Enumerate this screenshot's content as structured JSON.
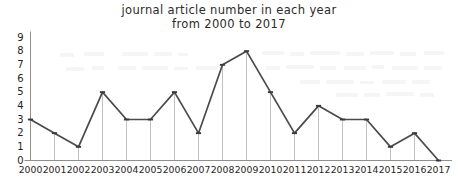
{
  "chart_data": {
    "type": "line",
    "title": "journal article number in each year from 2000 to 2017",
    "title_lines": [
      "journal article number in each year",
      "from 2000 to 2017"
    ],
    "xlabel": "",
    "ylabel": "",
    "categories": [
      "2000",
      "2001",
      "2002",
      "2003",
      "2004",
      "2005",
      "2006",
      "2007",
      "2008",
      "2009",
      "2010",
      "2011",
      "2012",
      "2013",
      "2014",
      "2015",
      "2016",
      "2017"
    ],
    "values": [
      3,
      2,
      1,
      5,
      3,
      3,
      5,
      2,
      7,
      8,
      5,
      2,
      4,
      3,
      3,
      1,
      2,
      0
    ],
    "series": [
      {
        "name": "journal article number",
        "values": [
          3,
          2,
          1,
          5,
          3,
          3,
          5,
          2,
          7,
          8,
          5,
          2,
          4,
          3,
          3,
          1,
          2,
          0
        ]
      }
    ],
    "ylim": [
      0,
      9
    ],
    "ytick_labels": [
      "0",
      "1",
      "2",
      "3",
      "4",
      "5",
      "6",
      "7",
      "8",
      "9"
    ],
    "yticks": [
      0,
      1,
      2,
      3,
      4,
      5,
      6,
      7,
      8,
      9
    ],
    "xtick_labels": [
      "2000",
      "2001",
      "2002",
      "2003",
      "2004",
      "2005",
      "2006",
      "2007",
      "2008",
      "2009",
      "2010",
      "2011",
      "2012",
      "2013",
      "2014",
      "2015",
      "2016",
      "2017"
    ],
    "grid": false,
    "droplines": true,
    "markers": true,
    "legend": null,
    "legend_position": "none",
    "colors": {
      "line": "#4a4a4a",
      "marker": "#3a3a3a",
      "dropline": "#b9b9b9",
      "axis": "#8f8f8f",
      "text": "#1f1f1f",
      "background": "#ffffff"
    }
  }
}
